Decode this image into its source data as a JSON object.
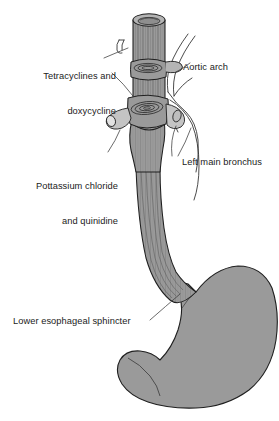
{
  "figure": {
    "colors": {
      "background": "#ffffff",
      "organ_fill": "#9a9a9a",
      "organ_fill_light": "#b4b4b4",
      "organ_fill_dark": "#828282",
      "outline": "#1f1f1f",
      "leader_line": "#3a3a3a",
      "text": "#1b1b1b"
    },
    "labels": {
      "tetracyclines": {
        "line1": "Tetracyclines and",
        "line2": "doxycycline"
      },
      "potassium": {
        "line1": "Pottassium chloride",
        "line2": "and quinidine"
      },
      "aortic_arch": "Aortic arch",
      "left_main_bronchus": "Left main bronchus",
      "lower_esophageal_sphincter": "Lower esophageal sphincter"
    },
    "structures": [
      "esophagus",
      "aortic-arch-constriction",
      "left-main-bronchus-constriction",
      "lower-esophageal-sphincter",
      "stomach"
    ]
  }
}
